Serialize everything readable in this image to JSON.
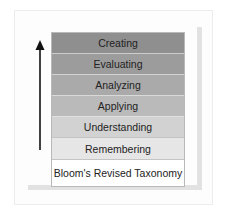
{
  "diagram": {
    "title": "Bloom's Revised Taxonomy",
    "direction_arrow": "arrow-up",
    "levels": [
      {
        "label": "Creating",
        "color": "#8f8f8f"
      },
      {
        "label": "Evaluating",
        "color": "#9c9c9c"
      },
      {
        "label": "Analyzing",
        "color": "#aaaaaa"
      },
      {
        "label": "Applying",
        "color": "#bababa"
      },
      {
        "label": "Understanding",
        "color": "#d2d2d2"
      },
      {
        "label": "Remembering",
        "color": "#e6e6e6"
      }
    ],
    "base_label": "Bloom's Revised Taxonomy"
  }
}
